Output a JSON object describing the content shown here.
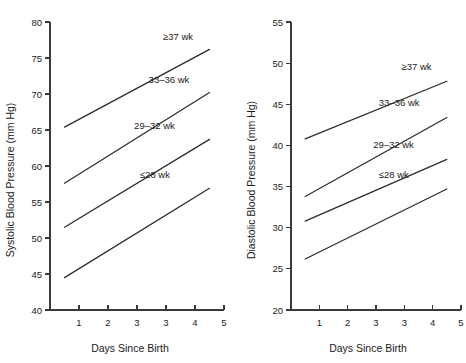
{
  "figure": {
    "panels": [
      {
        "id": "systolic",
        "ylabel": "Systolic Blood Pressure (mm Hg)",
        "xlabel": "Days Since Birth",
        "yticks": [
          "80",
          "75",
          "70",
          "65",
          "60",
          "55",
          "50",
          "45",
          "40"
        ],
        "xticks": [
          "1",
          "2",
          "3",
          "3",
          "4",
          "5"
        ],
        "series_labels": [
          "≥37 wk",
          "33–36 wk",
          "29–32 wk",
          "≤28 wk"
        ]
      },
      {
        "id": "diastolic",
        "ylabel": "Diastolic Blood Pressure (mm Hg)",
        "xlabel": "Days Since Birth",
        "yticks": [
          "55",
          "50",
          "45",
          "40",
          "35",
          "30",
          "25",
          "20"
        ],
        "xticks": [
          "1",
          "2",
          "3",
          "3",
          "4",
          "5"
        ],
        "series_labels": [
          "≥37 wk",
          "33–36 wk",
          "29–32 wk",
          "≤28 wk"
        ]
      }
    ]
  },
  "chart_data": [
    {
      "type": "line",
      "id": "systolic",
      "title": "",
      "xlabel": "Days Since Birth",
      "ylabel": "Systolic Blood Pressure (mm Hg)",
      "xlim": [
        0,
        6
      ],
      "ylim": [
        40,
        80
      ],
      "ytick_values": [
        40,
        45,
        50,
        55,
        60,
        65,
        70,
        75,
        80
      ],
      "xtick_values": [
        1,
        2,
        3,
        4,
        5,
        6
      ],
      "xtick_labels": [
        "1",
        "2",
        "3",
        "3",
        "4",
        "5"
      ],
      "grid": false,
      "legend": "inline-labels",
      "series": [
        {
          "name": "≥37 wk",
          "x": [
            0.5,
            5.5
          ],
          "y": [
            65.4,
            76.2
          ],
          "label_x": 3.9,
          "label_y": 78.0
        },
        {
          "name": "33–36 wk",
          "x": [
            0.5,
            5.5
          ],
          "y": [
            57.6,
            70.2
          ],
          "label_x": 3.4,
          "label_y": 72.0
        },
        {
          "name": "29–32 wk",
          "x": [
            0.5,
            5.5
          ],
          "y": [
            51.5,
            63.7
          ],
          "label_x": 2.9,
          "label_y": 65.6
        },
        {
          "name": "≤28 wk",
          "x": [
            0.5,
            5.5
          ],
          "y": [
            44.5,
            56.9
          ],
          "label_x": 3.1,
          "label_y": 58.8
        }
      ]
    },
    {
      "type": "line",
      "id": "diastolic",
      "title": "",
      "xlabel": "Days Since Birth",
      "ylabel": "Diastolic Blood Pressure (mm Hg)",
      "xlim": [
        0,
        6
      ],
      "ylim": [
        20,
        55
      ],
      "ytick_values": [
        20,
        25,
        30,
        35,
        40,
        45,
        50,
        55
      ],
      "xtick_values": [
        1,
        2,
        3,
        4,
        5,
        6
      ],
      "xtick_labels": [
        "1",
        "2",
        "3",
        "3",
        "4",
        "5"
      ],
      "grid": false,
      "legend": "inline-labels",
      "series": [
        {
          "name": "≥37 wk",
          "x": [
            0.5,
            5.5
          ],
          "y": [
            40.8,
            47.8
          ],
          "label_x": 3.9,
          "label_y": 49.6
        },
        {
          "name": "33–36 wk",
          "x": [
            0.5,
            5.5
          ],
          "y": [
            33.8,
            43.4
          ],
          "label_x": 3.1,
          "label_y": 45.2
        },
        {
          "name": "29–32 wk",
          "x": [
            0.5,
            5.5
          ],
          "y": [
            30.8,
            38.3
          ],
          "label_x": 2.9,
          "label_y": 40.1
        },
        {
          "name": "≤28 wk",
          "x": [
            0.5,
            5.5
          ],
          "y": [
            26.2,
            34.7
          ],
          "label_x": 3.1,
          "label_y": 36.5
        }
      ]
    }
  ],
  "colors": {
    "axis": "#3a3a3a",
    "line": "#2b2b2b",
    "text": "#1a1a1a",
    "background": "#ffffff"
  }
}
